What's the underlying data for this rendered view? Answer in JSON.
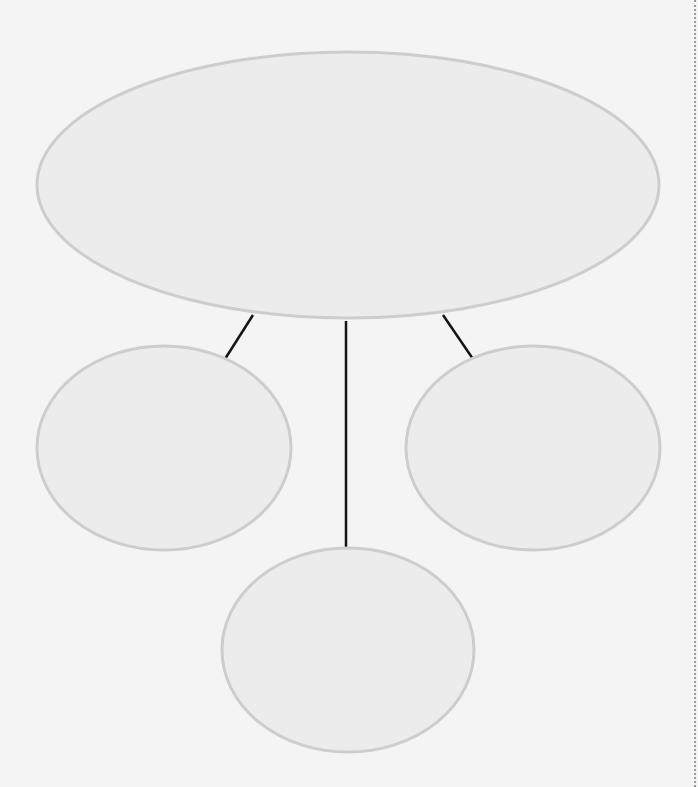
{
  "diagram": {
    "type": "graphic-organizer",
    "nodes": [
      {
        "id": "main",
        "label": "",
        "cx": 348,
        "cy": 185,
        "rx": 311,
        "ry": 133
      },
      {
        "id": "left",
        "label": "",
        "cx": 164,
        "cy": 448,
        "rx": 127,
        "ry": 102
      },
      {
        "id": "right",
        "label": "",
        "cx": 533,
        "cy": 448,
        "rx": 127,
        "ry": 102
      },
      {
        "id": "bottom",
        "label": "",
        "cx": 348,
        "cy": 650,
        "rx": 126,
        "ry": 102
      }
    ],
    "edges": [
      {
        "from": "main",
        "to": "left",
        "x1": 253,
        "y1": 315,
        "x2": 225,
        "y2": 359
      },
      {
        "from": "main",
        "to": "bottom",
        "x1": 346,
        "y1": 321,
        "x2": 346,
        "y2": 549
      },
      {
        "from": "main",
        "to": "right",
        "x1": 443,
        "y1": 315,
        "x2": 473,
        "y2": 359
      }
    ],
    "colors": {
      "background": "#f4f4f4",
      "node_fill": "#ececec",
      "node_stroke": "#cdcdcd",
      "line": "#141414"
    }
  }
}
